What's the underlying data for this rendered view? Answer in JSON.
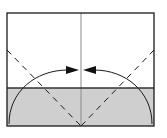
{
  "diagram": {
    "type": "origami-fold-diagram",
    "colors": {
      "background": "#ffffff",
      "outline": "#1a1a1a",
      "shaded_flap": "#cfcfcf",
      "center_line": "#8a8a8a"
    },
    "paper": {
      "x": 7,
      "y": 13,
      "width": 147,
      "height": 113
    },
    "flap": {
      "y_top": 88
    },
    "center_x": 81,
    "folds": [
      {
        "kind": "valley",
        "from": [
          7,
          50
        ],
        "to": [
          81,
          126
        ]
      },
      {
        "kind": "valley",
        "from": [
          154,
          50
        ],
        "to": [
          81,
          126
        ]
      }
    ],
    "arrows": [
      {
        "direction": "right",
        "tip": [
          79,
          70
        ]
      },
      {
        "direction": "left",
        "tip": [
          83,
          70
        ]
      }
    ]
  }
}
